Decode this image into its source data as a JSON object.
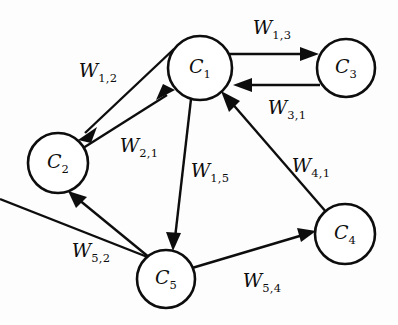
{
  "diagram": {
    "type": "directed-graph",
    "background_color": "#fdfdfd",
    "stroke_color": "#0d0d0d",
    "node_fill": "#ffffff",
    "nodes": [
      {
        "id": "C1",
        "base": "C",
        "subscript": "1",
        "cx": 200,
        "cy": 68,
        "r": 32
      },
      {
        "id": "C2",
        "base": "C",
        "subscript": "2",
        "cx": 58,
        "cy": 163,
        "r": 30
      },
      {
        "id": "C3",
        "base": "C",
        "subscript": "3",
        "cx": 346,
        "cy": 68,
        "r": 29
      },
      {
        "id": "C4",
        "base": "C",
        "subscript": "4",
        "cx": 345,
        "cy": 234,
        "r": 30
      },
      {
        "id": "C5",
        "base": "C",
        "subscript": "5",
        "cx": 166,
        "cy": 279,
        "r": 29
      }
    ],
    "edges": [
      {
        "id": "e12",
        "from": "C1",
        "to": "C2",
        "base": "W",
        "subscript": "1,2",
        "label_x": 98,
        "label_y": 72
      },
      {
        "id": "e21",
        "from": "C2",
        "to": "C1",
        "base": "W",
        "subscript": "2,1",
        "label_x": 139,
        "label_y": 147
      },
      {
        "id": "e13",
        "from": "C1",
        "to": "C3",
        "base": "W",
        "subscript": "1,3",
        "label_x": 272,
        "label_y": 29
      },
      {
        "id": "e31",
        "from": "C3",
        "to": "C1",
        "base": "W",
        "subscript": "3,1",
        "label_x": 287,
        "label_y": 109
      },
      {
        "id": "e15",
        "from": "C1",
        "to": "C5",
        "base": "W",
        "subscript": "1,5",
        "label_x": 210,
        "label_y": 172
      },
      {
        "id": "e41",
        "from": "C4",
        "to": "C1",
        "base": "W",
        "subscript": "4,1",
        "label_x": 311,
        "label_y": 167
      },
      {
        "id": "e52",
        "from": "C5",
        "to": "C2",
        "base": "W",
        "subscript": "5,2",
        "label_x": 91,
        "label_y": 252
      },
      {
        "id": "e54",
        "from": "C5",
        "to": "C4",
        "base": "W",
        "subscript": "5,4",
        "label_x": 262,
        "label_y": 282
      }
    ]
  }
}
